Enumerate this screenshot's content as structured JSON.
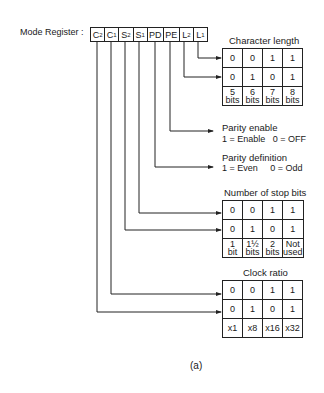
{
  "register": {
    "label": "Mode Register :",
    "bits": [
      {
        "name": "C",
        "sub": "2"
      },
      {
        "name": "C",
        "sub": "1"
      },
      {
        "name": "S",
        "sub": "2"
      },
      {
        "name": "S",
        "sub": "1"
      },
      {
        "name": "PD",
        "sub": ""
      },
      {
        "name": "PE",
        "sub": ""
      },
      {
        "name": "L",
        "sub": "2"
      },
      {
        "name": "L",
        "sub": "1"
      }
    ]
  },
  "character_length": {
    "title": "Character length",
    "rows": [
      [
        "0",
        "0",
        "1",
        "1"
      ],
      [
        "0",
        "1",
        "0",
        "1"
      ],
      [
        [
          "5",
          "bits"
        ],
        [
          "6",
          "bits"
        ],
        [
          "7",
          "bits"
        ],
        [
          "8",
          "bits"
        ]
      ]
    ]
  },
  "parity_enable": {
    "title": "Parity enable",
    "desc": "1 = Enable   0 = OFF"
  },
  "parity_definition": {
    "title": "Parity definition",
    "desc": "1 = Even     0 = Odd"
  },
  "stop_bits": {
    "title": "Number of stop bits",
    "rows": [
      [
        "0",
        "0",
        "1",
        "1"
      ],
      [
        "0",
        "1",
        "0",
        "1"
      ],
      [
        [
          "1",
          "bit"
        ],
        [
          "1½",
          "bits"
        ],
        [
          "2",
          "bits"
        ],
        [
          "Not",
          "used"
        ]
      ]
    ]
  },
  "clock_ratio": {
    "title": "Clock ratio",
    "rows": [
      [
        "0",
        "0",
        "1",
        "1"
      ],
      [
        "0",
        "1",
        "0",
        "1"
      ],
      [
        "x1",
        "x8",
        "x16",
        "x32"
      ]
    ]
  },
  "caption": "(a)"
}
